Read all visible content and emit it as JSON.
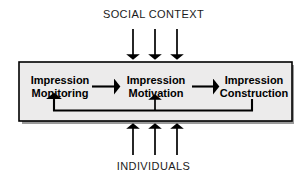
{
  "diagram": {
    "title_top": "SOCIAL CONTEXT",
    "title_bottom": "INDIVIDUALS",
    "container": {
      "fill": "#ecebeb",
      "border": "#000000",
      "shadow": "#9a9a9a"
    },
    "nodes": [
      {
        "id": "impression-monitoring",
        "line1": "Impression",
        "line2": "Monitoring"
      },
      {
        "id": "impression-motivation",
        "line1": "Impression",
        "line2": "Motivation"
      },
      {
        "id": "impression-construction",
        "line1": "Impression",
        "line2": "Construction"
      }
    ],
    "flow": {
      "connector_1": "Impression Monitoring to Impression Motivation",
      "connector_2": "Impression Motivation to Impression Construction",
      "feedback": "Impression Construction back to Impression Monitoring"
    },
    "inputs": {
      "top_arrow_count": 3,
      "bottom_arrow_count": 3,
      "top_source": "SOCIAL CONTEXT",
      "bottom_source": "INDIVIDUALS"
    },
    "colors": {
      "ink": "#000000",
      "label_text": "#1b1b1b",
      "background": "#ffffff"
    }
  }
}
